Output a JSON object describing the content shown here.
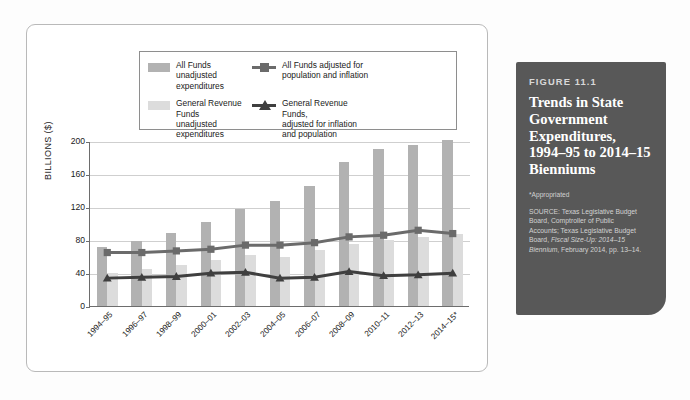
{
  "figure": {
    "number": "FIGURE 11.1",
    "title": "Trends in State Government Expenditures, 1994–95 to 2014–15 Bienniums",
    "note": "*Appropriated",
    "source_line1": "SOURCE: Texas Legislative Budget",
    "source_line2": "Board, Comptroller of Public",
    "source_line3": "Accounts; Texas Legislative Budget",
    "source_line4_pre": "Board, ",
    "source_line4_it": "Fiscal Size-Up: 2014–15",
    "source_line5_it": "Biennium",
    "source_line5_post": ", February 2014, pp. 13–14.",
    "box_color": "#585858"
  },
  "legend": {
    "items": [
      {
        "label_line1": "All Funds unadjusted",
        "label_line2": "expenditures",
        "type": "swatch",
        "color": "#b2b2b2"
      },
      {
        "label_line1": "All Funds adjusted for",
        "label_line2": "population and inflation",
        "label_line3": "",
        "type": "line-square",
        "color": "#6b6b6b"
      },
      {
        "label_line1": "General Revenue Funds",
        "label_line2": "unadjusted expenditures",
        "type": "swatch",
        "color": "#dcdcdc"
      },
      {
        "label_line1": "General Revenue Funds,",
        "label_line2": "adjusted for inflation",
        "label_line3": "and population",
        "type": "line-triangle",
        "color": "#3f3f3f"
      }
    ]
  },
  "chart_data": {
    "type": "bar",
    "title": "Trends in State Government Expenditures, 1994–95 to 2014–15 Bienniums",
    "xlabel": "",
    "ylabel": "BILLIONS ($)",
    "ylim": [
      0,
      200
    ],
    "yticks": [
      0,
      40,
      80,
      120,
      160,
      200
    ],
    "grid": true,
    "legend_position": "top",
    "categories": [
      "1994–95",
      "1996–97",
      "1998–99",
      "2000–01",
      "2002–03",
      "2004–05",
      "2006–07",
      "2008–09",
      "2010–11",
      "2012–13",
      "2014–15*"
    ],
    "series": [
      {
        "name": "All Funds unadjusted expenditures",
        "type": "bar",
        "color": "#b2b2b2",
        "values": [
          72,
          79,
          89,
          102,
          117,
          127,
          145,
          175,
          190,
          195,
          201
        ]
      },
      {
        "name": "General Revenue Funds unadjusted expenditures",
        "type": "bar",
        "color": "#dcdcdc",
        "values": [
          40,
          45,
          50,
          56,
          62,
          60,
          68,
          75,
          80,
          84,
          87
        ]
      },
      {
        "name": "All Funds adjusted for population and inflation",
        "type": "line",
        "marker": "square",
        "color": "#6b6b6b",
        "values": [
          66,
          66,
          68,
          70,
          75,
          75,
          78,
          85,
          87,
          93,
          89
        ]
      },
      {
        "name": "General Revenue Funds, adjusted for inflation and population",
        "type": "line",
        "marker": "triangle",
        "color": "#3f3f3f",
        "values": [
          35,
          36,
          37,
          41,
          42,
          35,
          36,
          43,
          38,
          39,
          41
        ]
      }
    ]
  }
}
